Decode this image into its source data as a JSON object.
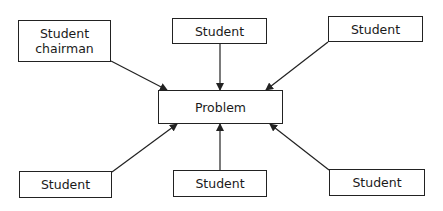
{
  "diagram": {
    "center": {
      "label": "Problem"
    },
    "nodes": [
      {
        "label_line1": "Student",
        "label_line2": "chairman"
      },
      {
        "label": "Student"
      },
      {
        "label": "Student"
      },
      {
        "label": "Student"
      },
      {
        "label": "Student"
      },
      {
        "label": "Student"
      }
    ],
    "edges": [
      {
        "from": "Student chairman",
        "to": "Problem"
      },
      {
        "from": "Student (top center)",
        "to": "Problem"
      },
      {
        "from": "Student (top right)",
        "to": "Problem"
      },
      {
        "from": "Student (bottom left)",
        "to": "Problem"
      },
      {
        "from": "Student (bottom center)",
        "to": "Problem"
      },
      {
        "from": "Student (bottom right)",
        "to": "Problem"
      }
    ]
  }
}
